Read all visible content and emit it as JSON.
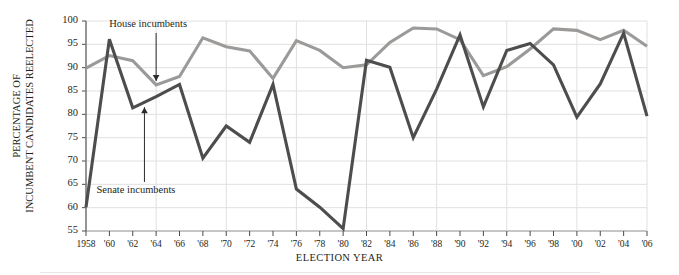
{
  "chart_data": {
    "type": "line",
    "title": "",
    "xlabel": "ELECTION YEAR",
    "ylabel_line1": "PERCENTAGE OF",
    "ylabel_line2": "INCUMBENT CANDIDATES REELECTED",
    "ylim": [
      55,
      100
    ],
    "ytick_labels": [
      "100",
      "95",
      "90",
      "85",
      "80",
      "75",
      "70",
      "65",
      "60",
      "55"
    ],
    "ytick_values": [
      100,
      95,
      90,
      85,
      80,
      75,
      70,
      65,
      60,
      55
    ],
    "grid": true,
    "legend_position": "inline-annotations",
    "x": [
      1958,
      1960,
      1962,
      1964,
      1966,
      1968,
      1970,
      1972,
      1974,
      1976,
      1978,
      1980,
      1982,
      1984,
      1986,
      1988,
      1990,
      1992,
      1994,
      1996,
      1998,
      2000,
      2002,
      2004,
      2006
    ],
    "xtick_labels": [
      "1958",
      "'60",
      "'62",
      "'64",
      "'66",
      "'68",
      "'70",
      "'72",
      "'74",
      "'76",
      "'78",
      "'80",
      "'82",
      "'84",
      "'86",
      "'88",
      "'90",
      "'92",
      "'94",
      "'96",
      "'98",
      "'00",
      "'02",
      "'04",
      "'06"
    ],
    "series": [
      {
        "name": "House incumbents",
        "color": "#9c9a98",
        "values": [
          89.9,
          92.6,
          91.5,
          86.3,
          88.1,
          96.4,
          94.5,
          93.6,
          87.7,
          95.8,
          93.7,
          90.0,
          90.6,
          95.4,
          98.5,
          98.3,
          96.0,
          88.3,
          90.2,
          94.0,
          98.3,
          98.0,
          96.0,
          98.0,
          94.6
        ]
      },
      {
        "name": "Senate incumbents",
        "color": "#4d4d4d",
        "values": [
          60.1,
          96.1,
          81.4,
          83.8,
          86.4,
          70.6,
          77.5,
          74.0,
          86.4,
          64.0,
          60.1,
          55.5,
          91.6,
          90.1,
          75.0,
          85.4,
          97.0,
          81.6,
          93.7,
          95.2,
          90.6,
          79.4,
          86.5,
          97.4,
          79.6
        ]
      }
    ],
    "annotations": [
      {
        "text": "House incumbents",
        "points_to_series": "House incumbents",
        "points_to_year": 1964
      },
      {
        "text": "Senate incumbents",
        "points_to_series": "Senate incumbents",
        "points_to_year": 1963
      }
    ]
  }
}
